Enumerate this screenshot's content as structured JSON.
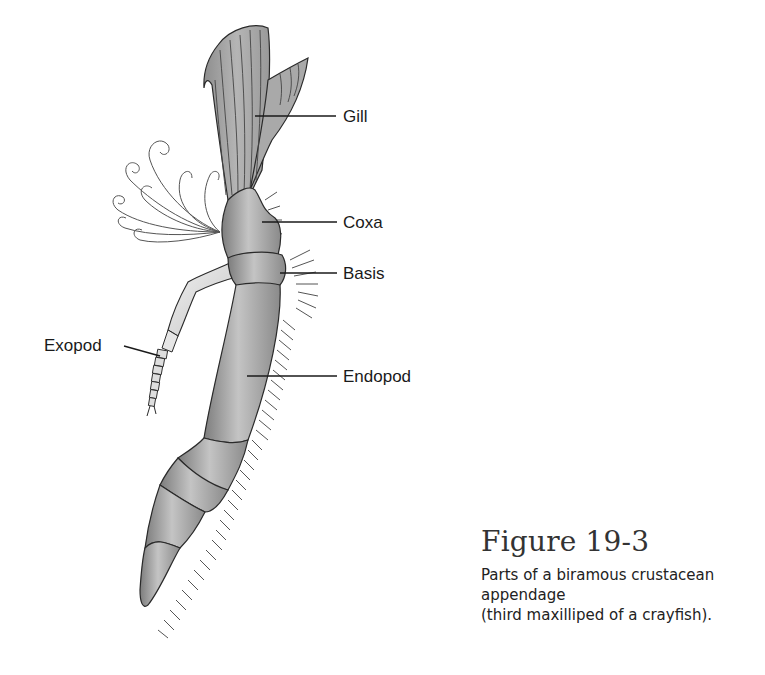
{
  "figure": {
    "title": "Figure 19-3",
    "caption_line1": "Parts of a biramous crustacean appendage",
    "caption_line2": "(third maxilliped of a crayfish)."
  },
  "labels": {
    "gill": "Gill",
    "coxa": "Coxa",
    "basis": "Basis",
    "exopod": "Exopod",
    "endopod": "Endopod"
  },
  "colors": {
    "body_fill": "#9a9a9a",
    "light_fill": "#d8d8d8",
    "outline": "#2a2a2a",
    "text": "#1a1a1a"
  }
}
